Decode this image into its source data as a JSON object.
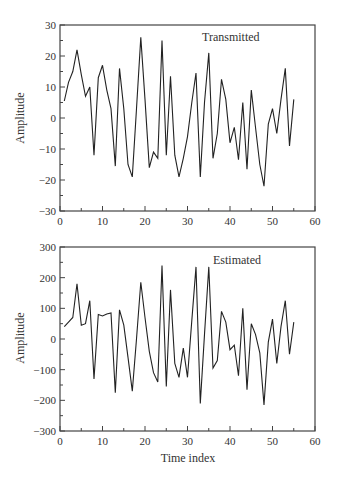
{
  "chart_data": [
    {
      "type": "line",
      "title": "Transmitted",
      "xlabel": "",
      "ylabel": "Amplitude",
      "xlim": [
        0,
        60
      ],
      "ylim": [
        -30,
        30
      ],
      "xticks": [
        0,
        10,
        20,
        30,
        40,
        50,
        60
      ],
      "yticks": [
        -30,
        -20,
        -10,
        0,
        10,
        20,
        30
      ],
      "grid": false,
      "legend": "none",
      "x": [
        1,
        2,
        3,
        4,
        5,
        6,
        7,
        8,
        9,
        10,
        11,
        12,
        13,
        14,
        15,
        16,
        17,
        18,
        19,
        20,
        21,
        22,
        23,
        24,
        25,
        26,
        27,
        28,
        29,
        30,
        31,
        32,
        33,
        34,
        35,
        36,
        37,
        38,
        39,
        40,
        41,
        42,
        43,
        44,
        45,
        46,
        47,
        48,
        49,
        50,
        51,
        52,
        53,
        54,
        55
      ],
      "series": [
        {
          "name": "Transmitted",
          "values": [
            5.5,
            11.5,
            15,
            22,
            14,
            7,
            10,
            -12,
            13,
            17,
            9,
            3,
            -15.5,
            16,
            3,
            -15,
            -19,
            3,
            26,
            6,
            -16,
            -11,
            -13,
            25,
            -12,
            13.5,
            -12,
            -19,
            -13,
            -6,
            5,
            14.5,
            -19,
            5,
            21,
            -13,
            -5,
            12.5,
            6,
            -8,
            -3,
            -13.5,
            5,
            -16.5,
            9,
            -3,
            -15,
            -22,
            -2,
            3,
            -5,
            6,
            16,
            -9,
            6
          ]
        }
      ]
    },
    {
      "type": "line",
      "title": "Estimated",
      "xlabel": "Time index",
      "ylabel": "Amplitude",
      "xlim": [
        0,
        60
      ],
      "ylim": [
        -300,
        300
      ],
      "xticks": [
        0,
        10,
        20,
        30,
        40,
        50,
        60
      ],
      "yticks": [
        -300,
        -200,
        -100,
        0,
        100,
        200,
        300
      ],
      "grid": false,
      "legend": "none",
      "x": [
        1,
        2,
        3,
        4,
        5,
        6,
        7,
        8,
        9,
        10,
        11,
        12,
        13,
        14,
        15,
        16,
        17,
        18,
        19,
        20,
        21,
        22,
        23,
        24,
        25,
        26,
        27,
        28,
        29,
        30,
        31,
        32,
        33,
        34,
        35,
        36,
        37,
        38,
        39,
        40,
        41,
        42,
        43,
        44,
        45,
        46,
        47,
        48,
        49,
        50,
        51,
        52,
        53,
        54,
        55
      ],
      "series": [
        {
          "name": "Estimated",
          "values": [
            40,
            55,
            70,
            180,
            45,
            50,
            125,
            -130,
            80,
            75,
            82,
            85,
            -175,
            95,
            45,
            -60,
            -170,
            0,
            185,
            70,
            -40,
            -110,
            -140,
            240,
            -155,
            160,
            -80,
            -125,
            -30,
            -125,
            60,
            235,
            -210,
            15,
            235,
            -95,
            -70,
            90,
            55,
            -35,
            -20,
            -120,
            100,
            -165,
            50,
            15,
            -45,
            -215,
            -10,
            65,
            -80,
            40,
            125,
            -50,
            55
          ]
        }
      ]
    }
  ],
  "panels": {
    "top": {
      "title": "Transmitted",
      "ylabel": "Amplitude",
      "xlabel": ""
    },
    "bottom": {
      "title": "Estimated",
      "ylabel": "Amplitude",
      "xlabel": "Time index"
    }
  },
  "colors": {
    "line": "#222222",
    "axis": "#444444",
    "text": "#333333",
    "background": "#ffffff"
  }
}
